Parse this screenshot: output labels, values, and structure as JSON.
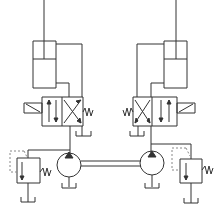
{
  "diagram": {
    "stroke_color": "#333333",
    "dashed_color": "#888888",
    "background": "#ffffff",
    "components": [
      {
        "id": "cylinder-left",
        "type": "double-acting-cylinder"
      },
      {
        "id": "cylinder-right",
        "type": "double-acting-cylinder"
      },
      {
        "id": "valve-left",
        "type": "4/2 solenoid directional valve, spring return"
      },
      {
        "id": "valve-right",
        "type": "4/2 solenoid directional valve, spring return"
      },
      {
        "id": "pump-left",
        "type": "fixed displacement pump"
      },
      {
        "id": "pump-right",
        "type": "fixed displacement pump"
      },
      {
        "id": "relief-left",
        "type": "pressure relief valve"
      },
      {
        "id": "relief-right",
        "type": "pressure relief valve"
      },
      {
        "id": "shaft",
        "type": "common drive shaft"
      }
    ],
    "labels": []
  }
}
